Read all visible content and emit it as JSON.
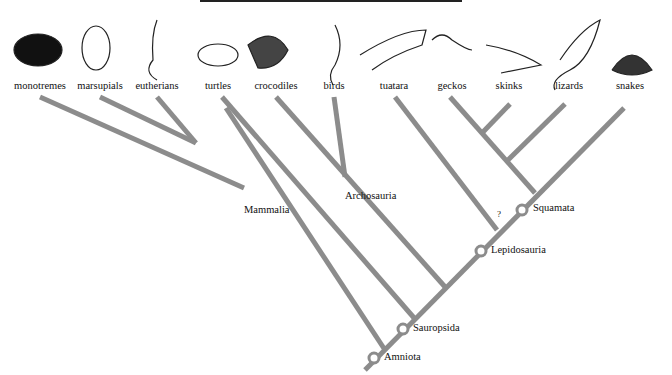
{
  "diagram": {
    "type": "cladogram",
    "line_color": "#8c8c8c",
    "taxa": [
      {
        "id": "monotremes",
        "label": "monotremes",
        "x": 40,
        "icon": "echidna-icon"
      },
      {
        "id": "marsupials",
        "label": "marsupials",
        "x": 100,
        "icon": "koala-icon"
      },
      {
        "id": "eutherians",
        "label": "eutherians",
        "x": 157,
        "icon": "ferret-icon"
      },
      {
        "id": "turtles",
        "label": "turtles",
        "x": 218,
        "icon": "turtle-icon"
      },
      {
        "id": "crocodiles",
        "label": "crocodiles",
        "x": 276,
        "icon": "crocodile-icon"
      },
      {
        "id": "birds",
        "label": "birds",
        "x": 334,
        "icon": "bird-icon"
      },
      {
        "id": "tuatara",
        "label": "tuatara",
        "x": 394,
        "icon": "tuatara-icon"
      },
      {
        "id": "geckos",
        "label": "geckos",
        "x": 452,
        "icon": "gecko-icon"
      },
      {
        "id": "skinks",
        "label": "skinks",
        "x": 509,
        "icon": "skink-icon"
      },
      {
        "id": "lizards",
        "label": "lizards",
        "x": 569,
        "icon": "lizard-icon"
      },
      {
        "id": "snakes",
        "label": "snakes",
        "x": 630,
        "icon": "cobra-icon"
      }
    ],
    "clades": [
      {
        "id": "mammalia",
        "label": "Mammalia",
        "x": 244,
        "y": 210
      },
      {
        "id": "archosauria",
        "label": "Archosauria",
        "x": 345,
        "y": 196
      },
      {
        "id": "squamata",
        "label": "Squamata",
        "x": 533,
        "y": 205
      },
      {
        "id": "lepidosauria",
        "label": "Lepidosauria",
        "x": 491,
        "y": 248
      },
      {
        "id": "sauropsida",
        "label": "Sauropsida",
        "x": 413,
        "y": 326
      },
      {
        "id": "amniota",
        "label": "Amniota",
        "x": 384,
        "y": 356
      }
    ],
    "uncertain_marker": "?"
  }
}
